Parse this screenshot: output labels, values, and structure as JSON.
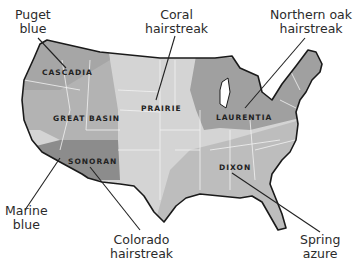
{
  "map": {
    "subject": "United States ecoregions with butterfly callouts",
    "regions": [
      {
        "id": "cascadia",
        "label": "CASCADIA",
        "color": "#a9a9a9"
      },
      {
        "id": "great_basin",
        "label": "GREAT BASIN",
        "color": "#b4b4b4"
      },
      {
        "id": "sonoran",
        "label": "SONORAN",
        "color": "#8c8c8c"
      },
      {
        "id": "prairie",
        "label": "PRAIRIE",
        "color": "#d3d3d3"
      },
      {
        "id": "laurentia",
        "label": "LAURENTIA",
        "color": "#a0a0a0"
      },
      {
        "id": "dixon",
        "label": "DIXON",
        "color": "#bdbdbd"
      }
    ],
    "callouts": [
      {
        "id": "puget",
        "line1": "Puget",
        "line2": "blue"
      },
      {
        "id": "coral",
        "line1": "Coral",
        "line2": "hairstreak"
      },
      {
        "id": "northern_oak",
        "line1": "Northern oak",
        "line2": "hairstreak"
      },
      {
        "id": "marine",
        "line1": "Marine",
        "line2": "blue"
      },
      {
        "id": "colorado",
        "line1": "Colorado",
        "line2": "hairstreak"
      },
      {
        "id": "spring",
        "line1": "Spring",
        "line2": "azure"
      }
    ],
    "colors": {
      "outline": "#1a1a1a",
      "state_lines": "#f0f0f0",
      "leader": "#222222",
      "text": "#2b2b2b"
    }
  }
}
